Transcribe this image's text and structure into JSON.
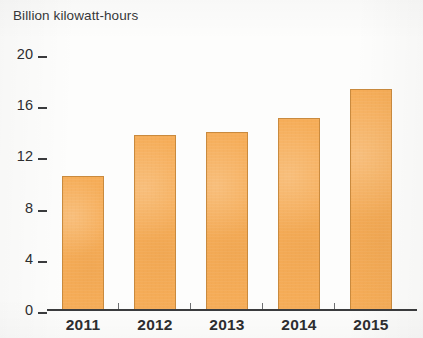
{
  "chart_data": {
    "type": "bar",
    "title": "Billion kilowatt-hours",
    "xlabel": "",
    "ylabel": "Billion kilowatt-hours",
    "categories": [
      "2011",
      "2012",
      "2013",
      "2014",
      "2015"
    ],
    "values": [
      10.5,
      13.7,
      13.9,
      15.0,
      17.3
    ],
    "series": [
      {
        "name": "Billion kilowatt-hours",
        "values": [
          10.5,
          13.7,
          13.9,
          15.0,
          17.3
        ]
      }
    ],
    "ylim": [
      0,
      20
    ],
    "yticks": [
      0,
      4,
      8,
      12,
      16,
      20
    ],
    "ytick_labels": [
      "0",
      "4",
      "8",
      "12",
      "16",
      "20"
    ],
    "grid": false,
    "legend": false,
    "legend_position": "none",
    "bar_color": "#f6ad58",
    "bar_border_color": "#c98a3e",
    "axis_color": "#3a3b3d",
    "text_color": "#2d2e30",
    "background_color": "#fdfdfc"
  },
  "axes": {
    "y_ticks": [
      {
        "label": "20",
        "value": 20
      },
      {
        "label": "16",
        "value": 16
      },
      {
        "label": "12",
        "value": 12
      },
      {
        "label": "8",
        "value": 8
      },
      {
        "label": "4",
        "value": 4
      },
      {
        "label": "0",
        "value": 0
      }
    ],
    "x_ticks": [
      {
        "label": "2011"
      },
      {
        "label": "2012"
      },
      {
        "label": "2013"
      },
      {
        "label": "2014"
      },
      {
        "label": "2015"
      }
    ]
  },
  "bars": [
    {
      "category": "2011",
      "value": 10.5
    },
    {
      "category": "2012",
      "value": 13.7
    },
    {
      "category": "2013",
      "value": 13.9
    },
    {
      "category": "2014",
      "value": 15.0
    },
    {
      "category": "2015",
      "value": 17.3
    }
  ]
}
